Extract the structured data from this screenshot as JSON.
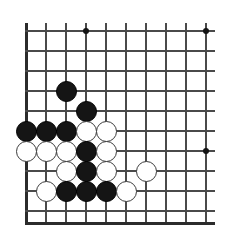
{
  "figure": {
    "kind": "go-board-diagram",
    "width": 234,
    "height": 239,
    "background_color": "#ffffff"
  },
  "board": {
    "visible_columns": 10,
    "visible_rows": 10,
    "origin_x": 26,
    "origin_y": 31,
    "spacing": 20,
    "line_color": "#4a4a4a",
    "edge_color": "#2b2b2b",
    "stone_radius": 10.5,
    "edges": {
      "left": true,
      "bottom": true,
      "top": false,
      "right": false
    },
    "star_points": [
      {
        "col": 4,
        "row": 1
      },
      {
        "col": 10,
        "row": 1
      },
      {
        "col": 10,
        "row": 7
      }
    ],
    "stones": [
      {
        "color": "black",
        "col": 3,
        "row": 4
      },
      {
        "color": "black",
        "col": 4,
        "row": 5
      },
      {
        "color": "black",
        "col": 1,
        "row": 6
      },
      {
        "color": "black",
        "col": 2,
        "row": 6
      },
      {
        "color": "black",
        "col": 3,
        "row": 6
      },
      {
        "color": "white",
        "col": 4,
        "row": 6
      },
      {
        "color": "white",
        "col": 5,
        "row": 6
      },
      {
        "color": "white",
        "col": 1,
        "row": 7
      },
      {
        "color": "white",
        "col": 2,
        "row": 7
      },
      {
        "color": "white",
        "col": 3,
        "row": 7
      },
      {
        "color": "black",
        "col": 4,
        "row": 7
      },
      {
        "color": "white",
        "col": 5,
        "row": 7
      },
      {
        "color": "white",
        "col": 3,
        "row": 8
      },
      {
        "color": "black",
        "col": 4,
        "row": 8
      },
      {
        "color": "white",
        "col": 5,
        "row": 8
      },
      {
        "color": "white",
        "col": 7,
        "row": 8
      },
      {
        "color": "white",
        "col": 2,
        "row": 9
      },
      {
        "color": "black",
        "col": 3,
        "row": 9
      },
      {
        "color": "black",
        "col": 4,
        "row": 9
      },
      {
        "color": "black",
        "col": 5,
        "row": 9
      },
      {
        "color": "white",
        "col": 6,
        "row": 9
      }
    ],
    "colors": {
      "black_stone": "#151515",
      "white_stone": "#ffffff",
      "white_stone_border": "#3b3b3b",
      "star": "#141414"
    }
  }
}
